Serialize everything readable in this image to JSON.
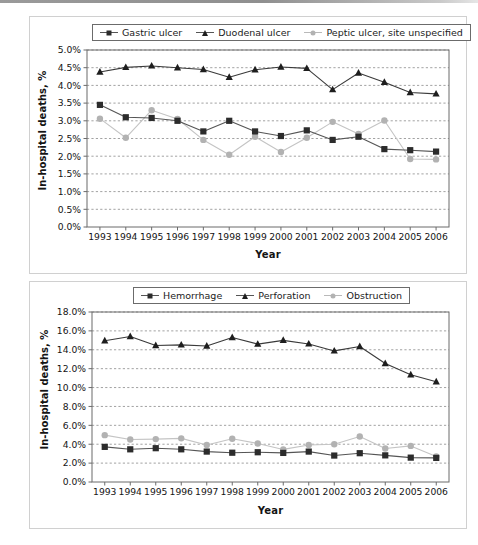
{
  "figure": {
    "background": "#ffffff",
    "panel_border_color": "#d0d0d0",
    "colors": {
      "series_dark": "#2c2c2c",
      "series_mid": "#555555",
      "series_light": "#b2b2b2",
      "gridline": "#8a8a8a",
      "axis": "#6b6b6b",
      "text": "#141414"
    }
  },
  "chart_data": [
    {
      "id": "ulcer-site-chart",
      "type": "line",
      "title": "",
      "xlabel": "Year",
      "ylabel": "In-hospital deaths, %",
      "x": [
        1993,
        1994,
        1995,
        1996,
        1997,
        1998,
        1999,
        2000,
        2001,
        2002,
        2003,
        2004,
        2005,
        2006
      ],
      "categories": [
        "1993",
        "1994",
        "1995",
        "1996",
        "1997",
        "1998",
        "1999",
        "2000",
        "2001",
        "2002",
        "2003",
        "2004",
        "2005",
        "2006"
      ],
      "ylim": [
        0.0,
        5.0
      ],
      "yticks": [
        0.0,
        0.5,
        1.0,
        1.5,
        2.0,
        2.5,
        3.0,
        3.5,
        4.0,
        4.5,
        5.0
      ],
      "ytick_labels": [
        "0.0%",
        "0.5%",
        "1.0%",
        "1.5%",
        "2.0%",
        "2.5%",
        "3.0%",
        "3.5%",
        "4.0%",
        "4.5%",
        "5.0%"
      ],
      "grid": true,
      "legend_position": "top",
      "series": [
        {
          "name": "Gastric ulcer",
          "marker": "square",
          "color": "#2c2c2c",
          "line_color": "#555555",
          "values": [
            3.45,
            3.1,
            3.08,
            3.0,
            2.7,
            3.0,
            2.7,
            2.57,
            2.73,
            2.46,
            2.55,
            2.2,
            2.17,
            2.13
          ]
        },
        {
          "name": "Duodenal ulcer",
          "marker": "triangle",
          "color": "#1e1e1e",
          "line_color": "#3a3a3a",
          "values": [
            4.38,
            4.51,
            4.55,
            4.5,
            4.45,
            4.23,
            4.44,
            4.52,
            4.48,
            3.88,
            4.35,
            4.09,
            3.8,
            3.76
          ]
        },
        {
          "name": "Peptic ulcer, site unspecified",
          "marker": "circle",
          "color": "#b2b2b2",
          "line_color": "#c4c4c4",
          "values": [
            3.06,
            2.52,
            3.3,
            3.05,
            2.46,
            2.04,
            2.55,
            2.12,
            2.52,
            2.97,
            2.63,
            3.01,
            1.92,
            1.91
          ]
        }
      ]
    },
    {
      "id": "ulcer-complication-chart",
      "type": "line",
      "title": "",
      "xlabel": "Year",
      "ylabel": "In-hospital deaths, %",
      "x": [
        1993,
        1994,
        1995,
        1996,
        1997,
        1998,
        1999,
        2000,
        2001,
        2002,
        2003,
        2004,
        2005,
        2006
      ],
      "categories": [
        "1993",
        "1994",
        "1995",
        "1996",
        "1997",
        "1998",
        "1999",
        "2000",
        "2001",
        "2002",
        "2003",
        "2004",
        "2005",
        "2006"
      ],
      "ylim": [
        0.0,
        18.0
      ],
      "yticks": [
        0.0,
        2.0,
        4.0,
        6.0,
        8.0,
        10.0,
        12.0,
        14.0,
        16.0,
        18.0
      ],
      "ytick_labels": [
        "0.0%",
        "2.0%",
        "4.0%",
        "6.0%",
        "8.0%",
        "10.0%",
        "12.0%",
        "14.0%",
        "16.0%",
        "18.0%"
      ],
      "grid": true,
      "legend_position": "top",
      "series": [
        {
          "name": "Hemorrhage",
          "marker": "square",
          "color": "#2c2c2c",
          "line_color": "#555555",
          "values": [
            3.72,
            3.46,
            3.58,
            3.46,
            3.22,
            3.1,
            3.15,
            3.08,
            3.22,
            2.8,
            3.05,
            2.82,
            2.58,
            2.55
          ]
        },
        {
          "name": "Perforation",
          "marker": "triangle",
          "color": "#1e1e1e",
          "line_color": "#3a3a3a",
          "values": [
            14.95,
            15.4,
            14.45,
            14.52,
            14.4,
            15.3,
            14.6,
            15.0,
            14.62,
            13.88,
            14.35,
            12.55,
            11.35,
            10.62
          ]
        },
        {
          "name": "Obstruction",
          "marker": "circle",
          "color": "#b2b2b2",
          "line_color": "#c4c4c4",
          "values": [
            4.96,
            4.5,
            4.54,
            4.62,
            3.92,
            4.58,
            4.08,
            3.45,
            3.92,
            4.0,
            4.82,
            3.55,
            3.82,
            2.7
          ]
        }
      ]
    }
  ]
}
